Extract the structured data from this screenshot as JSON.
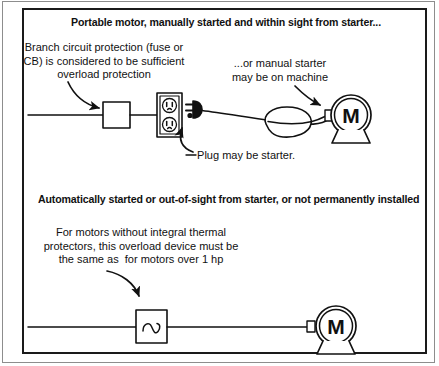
{
  "figure": {
    "ink_color": "#111111",
    "background_color": "#ffffff",
    "frame_color": "#1a1a1a"
  },
  "sections": [
    {
      "id": "top",
      "heading": "Portable motor, manually started and within sight from starter...",
      "captions": [
        {
          "id": "branch-circuit-protection",
          "text": "Branch circuit protection (fuse or\nCB) is considered to be sufficient\noverload protection"
        },
        {
          "id": "manual-starter",
          "text": "...or manual starter\nmay be on machine"
        },
        {
          "id": "plug-starter",
          "text": "Plug may be starter."
        }
      ],
      "circuit": {
        "elements": [
          "supply-line",
          "branch-circuit-protection-box",
          "duplex-receptacle",
          "cord-plug",
          "flexible-cord",
          "machine-body",
          "motor"
        ],
        "motor_label": "M"
      }
    },
    {
      "id": "bottom",
      "heading": "Automatically started or out-of-sight from starter, or not permanently installed",
      "captions": [
        {
          "id": "overload-device",
          "text": "For motors without integral thermal\nprotectors, this overload device must be\nthe same as  for motors over 1 hp"
        }
      ],
      "circuit": {
        "elements": [
          "supply-line",
          "overload-relay-box",
          "motor"
        ],
        "motor_label": "M",
        "overload_symbol": "overload-relay-curve"
      }
    }
  ]
}
